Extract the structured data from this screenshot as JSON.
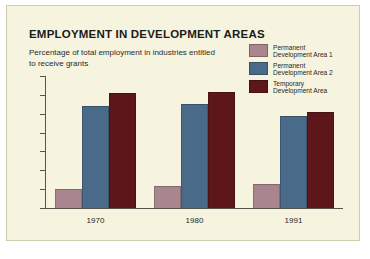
{
  "figure": {
    "title": "EMPLOYMENT IN DEVELOPMENT AREAS",
    "subtitle": "Percentage of total employment in industries entitled to receive grants",
    "background_color": "#f6f4df",
    "border_color": "#cfcbae"
  },
  "legend": {
    "position": "top-right",
    "entries": [
      {
        "label": "Permanent\nDevelopment Area 1",
        "color": "#a9868d"
      },
      {
        "label": "Permanent\nDevelopment Area 2",
        "color": "#4a6a8a"
      },
      {
        "label": "Temporary\nDevelopment Area",
        "color": "#5d1619"
      }
    ]
  },
  "chart_data": {
    "type": "bar",
    "title": "EMPLOYMENT IN DEVELOPMENT AREAS",
    "subtitle": "Percentage of total employment in industries entitled to receive grants",
    "xlabel": "",
    "ylabel": "",
    "categories": [
      "1970",
      "1980",
      "1991"
    ],
    "ylim": [
      0,
      7
    ],
    "yticks": [
      0,
      1,
      2,
      3,
      4,
      5,
      6,
      7
    ],
    "ytick_labels": [
      "0",
      "1",
      "2",
      "3",
      "4",
      "5",
      "6",
      "7"
    ],
    "grid": false,
    "series": [
      {
        "name": "Permanent Development Area 1",
        "color": "#a9868d",
        "values": [
          1.0,
          1.15,
          1.3
        ]
      },
      {
        "name": "Permanent Development Area 2",
        "color": "#4a6a8a",
        "values": [
          5.4,
          5.5,
          4.9
        ]
      },
      {
        "name": "Temporary Development Area",
        "color": "#5d1619",
        "values": [
          6.1,
          6.15,
          5.1
        ]
      }
    ]
  }
}
